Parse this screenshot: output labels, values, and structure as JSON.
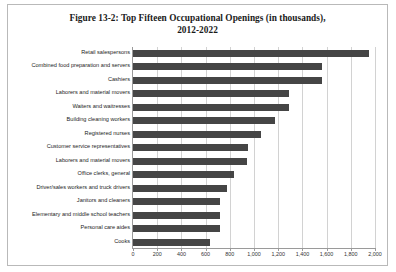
{
  "figure": {
    "title_line1": "Figure 13-2: Top Fifteen Occupational Openings (in thousands),",
    "title_line2": "2012-2022"
  },
  "chart_data": {
    "type": "bar",
    "orientation": "horizontal",
    "title": "Figure 13-2: Top Fifteen Occupational Openings (in thousands), 2012-2022",
    "xlabel": "",
    "ylabel": "",
    "xlim": [
      0,
      2000
    ],
    "xticks": [
      0,
      200,
      400,
      600,
      800,
      1000,
      1200,
      1400,
      1600,
      1800,
      2000
    ],
    "xtick_labels": [
      "0",
      "200",
      "400",
      "600",
      "800",
      "1,000",
      "1,200",
      "1,400",
      "1,600",
      "1,800",
      "2,000"
    ],
    "grid": true,
    "legend": false,
    "bar_color": "#454545",
    "categories": [
      "Retail salespersons",
      "Combined food preparation and servers",
      "Cashiers",
      "Laborers and material movers",
      "Waiters and waitresses",
      "Building cleaning workers",
      "Registered nurses",
      "Customer service representatives",
      "Laborers and material movers",
      "Office clerks, general",
      "Driver/sales workers and truck drivers",
      "Janitors and cleaners",
      "Elementary and middle school teachers",
      "Personal care aides",
      "Cooks"
    ],
    "values": [
      1950,
      1560,
      1560,
      1290,
      1290,
      1170,
      1060,
      950,
      940,
      835,
      780,
      720,
      720,
      715,
      640
    ]
  }
}
